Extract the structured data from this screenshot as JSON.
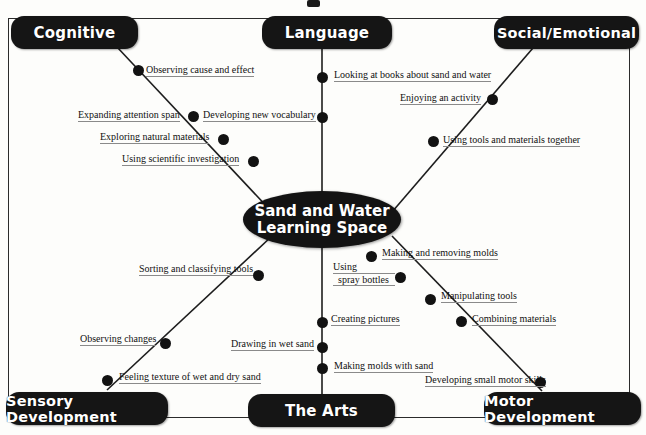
{
  "diagram": {
    "type": "mind-map",
    "center": {
      "line1": "Sand and Water",
      "line2": "Learning Space"
    },
    "branches": [
      {
        "id": "cognitive",
        "label": "Cognitive",
        "position": "top-left",
        "leaves": [
          "Observing cause and effect",
          "Expanding attention span",
          "Exploring natural materials",
          "Using scientific investigation"
        ]
      },
      {
        "id": "language",
        "label": "Language",
        "position": "top-center",
        "leaves": [
          "Looking at books about sand and water",
          "Developing new vocabulary"
        ]
      },
      {
        "id": "social-emotional",
        "label": "Social/Emotional",
        "position": "top-right",
        "leaves": [
          "Enjoying an activity",
          "Using tools and materials together"
        ]
      },
      {
        "id": "sensory-development",
        "label": "Sensory Development",
        "position": "bottom-left",
        "leaves": [
          "Sorting and classifying tools",
          "Observing changes",
          "Feeling texture of wet and dry sand"
        ]
      },
      {
        "id": "the-arts",
        "label": "The Arts",
        "position": "bottom-center",
        "leaves": [
          "Creating pictures",
          "Drawing in wet sand",
          "Making molds with sand"
        ]
      },
      {
        "id": "motor-development",
        "label": "Motor Development",
        "position": "bottom-right",
        "leaves": [
          "Making and removing molds",
          "Using spray bottles",
          "Manipulating tools",
          "Combining materials",
          "Developing small motor skills"
        ]
      }
    ],
    "leaf_text": {
      "observing_cause_effect": "Observing cause and effect",
      "expanding_attention_span": "Expanding attention span",
      "exploring_natural_materials": "Exploring natural materials",
      "using_scientific_investigation": "Using scientific investigation",
      "looking_at_books": "Looking at books about sand and water",
      "developing_new_vocabulary": "Developing new vocabulary",
      "enjoying_an_activity": "Enjoying an activity",
      "using_tools_together": "Using tools and materials together",
      "sorting_classifying_tools": "Sorting and classifying tools",
      "observing_changes": "Observing changes",
      "feeling_texture": "Feeling texture of wet and dry sand",
      "creating_pictures": "Creating pictures",
      "drawing_in_wet_sand": "Drawing in wet sand",
      "making_molds_with_sand": "Making molds with sand",
      "making_removing_molds": "Making and removing molds",
      "using_spray_bottles_l1": "Using",
      "using_spray_bottles_l2": "spray bottles",
      "manipulating_tools": "Manipulating tools",
      "combining_materials": "Combining materials",
      "developing_small_motor_skills": "Developing small motor skills"
    },
    "colors": {
      "node_fill": "#151515",
      "node_text": "#ffffff",
      "leaf_text": "#111111",
      "edge": "#1d1d1d",
      "frame": "#2b2b2b",
      "background": "#fdfdfb",
      "underline": "#8a8a8a"
    }
  }
}
